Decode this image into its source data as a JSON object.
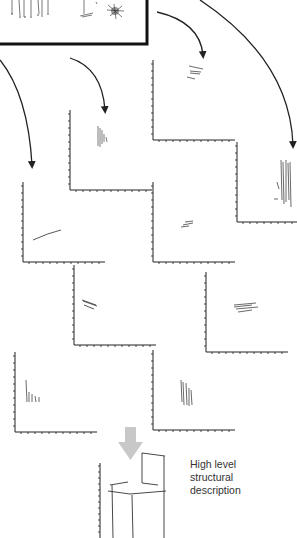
{
  "figure": {
    "description_label_line1": "High level",
    "description_label_line2": "structural",
    "description_label_line3": "description",
    "colors": {
      "stroke": "#222222",
      "arrow_down": "#c8c8c8",
      "background": "#ffffff"
    },
    "panels": [
      {
        "id": "source-sketch-box",
        "x": 0,
        "y": 0,
        "w": 147,
        "h": 44
      },
      {
        "id": "plot-top-right-mid",
        "x": 152,
        "y": 60
      },
      {
        "id": "plot-mid-left-high",
        "x": 68,
        "y": 98
      },
      {
        "id": "plot-far-right",
        "x": 236,
        "y": 142
      },
      {
        "id": "plot-left",
        "x": 22,
        "y": 180
      },
      {
        "id": "plot-center",
        "x": 152,
        "y": 180
      },
      {
        "id": "plot-center-left-low",
        "x": 72,
        "y": 265
      },
      {
        "id": "plot-right-low",
        "x": 205,
        "y": 270
      },
      {
        "id": "plot-bottom-left",
        "x": 15,
        "y": 350
      },
      {
        "id": "plot-bottom-center",
        "x": 152,
        "y": 347
      },
      {
        "id": "result-chair",
        "x": 100,
        "y": 465
      }
    ]
  }
}
